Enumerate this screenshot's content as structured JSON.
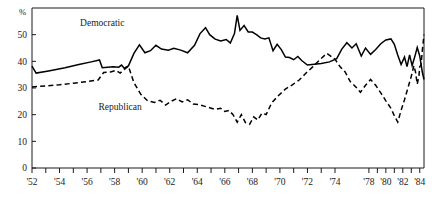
{
  "chart_data": {
    "type": "line",
    "title": "",
    "xlabel": "",
    "ylabel": "%",
    "ylim": [
      0,
      60
    ],
    "xlim": [
      1952,
      1984.5
    ],
    "grid": false,
    "legend": "inline-annotations",
    "ytick_labels": [
      "0",
      "10",
      "20",
      "30",
      "40",
      "50"
    ],
    "ytick_values": [
      0,
      10,
      20,
      30,
      40,
      50
    ],
    "xtick_labels": [
      "'52",
      "'54",
      "'56",
      "'58",
      "'60",
      "'62",
      "'64",
      "'66",
      "'68",
      "'70",
      "'72",
      "'74",
      "'78",
      "'80",
      "'82",
      "'84"
    ],
    "xtick_values": [
      1952,
      1954,
      1956,
      1958,
      1960,
      1962,
      1964,
      1966,
      1968,
      1970,
      1972,
      1974,
      1978,
      1980,
      1982,
      1984
    ],
    "minor_xticks": [
      1953,
      1955,
      1957,
      1959,
      1961,
      1963,
      1965,
      1967,
      1969,
      1971,
      1973,
      1979,
      1981,
      1983
    ],
    "series": [
      {
        "name": "Democratic",
        "style": "solid",
        "color": "#000000",
        "annotation": "Democratic",
        "annotation_x": 1957.1,
        "annotation_y": 53.2,
        "points": [
          [
            1952.0,
            38.2
          ],
          [
            1952.3,
            35.6
          ],
          [
            1953.2,
            36.4
          ],
          [
            1954.4,
            37.6
          ],
          [
            1955.4,
            38.8
          ],
          [
            1956.3,
            39.8
          ],
          [
            1956.9,
            40.5
          ],
          [
            1957.1,
            37.6
          ],
          [
            1957.9,
            38.0
          ],
          [
            1958.3,
            37.8
          ],
          [
            1958.5,
            38.6
          ],
          [
            1958.7,
            37.4
          ],
          [
            1959.0,
            38.3
          ],
          [
            1959.4,
            43.0
          ],
          [
            1959.8,
            46.2
          ],
          [
            1960.2,
            43.2
          ],
          [
            1960.6,
            44.0
          ],
          [
            1961.0,
            46.0
          ],
          [
            1961.4,
            44.6
          ],
          [
            1961.9,
            44.2
          ],
          [
            1962.3,
            44.9
          ],
          [
            1962.8,
            44.2
          ],
          [
            1963.3,
            43.2
          ],
          [
            1963.8,
            46.0
          ],
          [
            1964.2,
            50.4
          ],
          [
            1964.6,
            52.6
          ],
          [
            1964.9,
            50.0
          ],
          [
            1965.3,
            48.3
          ],
          [
            1965.7,
            47.6
          ],
          [
            1966.1,
            48.2
          ],
          [
            1966.4,
            46.9
          ],
          [
            1966.7,
            50.4
          ],
          [
            1966.9,
            57.2
          ],
          [
            1967.1,
            51.6
          ],
          [
            1967.4,
            53.4
          ],
          [
            1967.7,
            51.0
          ],
          [
            1968.0,
            51.0
          ],
          [
            1968.3,
            50.0
          ],
          [
            1968.6,
            48.8
          ],
          [
            1968.9,
            48.4
          ],
          [
            1969.2,
            48.8
          ],
          [
            1969.5,
            44.0
          ],
          [
            1969.8,
            46.4
          ],
          [
            1970.1,
            44.4
          ],
          [
            1970.4,
            41.6
          ],
          [
            1970.7,
            41.4
          ],
          [
            1971.0,
            40.6
          ],
          [
            1971.3,
            41.8
          ],
          [
            1971.6,
            40.2
          ],
          [
            1972.0,
            38.6
          ],
          [
            1972.5,
            38.9
          ],
          [
            1973.0,
            39.2
          ],
          [
            1973.6,
            39.8
          ],
          [
            1974.2,
            41.0
          ],
          [
            1974.8,
            44.6
          ],
          [
            1975.4,
            47.0
          ],
          [
            1976.0,
            45.0
          ],
          [
            1976.5,
            46.6
          ],
          [
            1977.1,
            42.0
          ],
          [
            1977.6,
            45.0
          ],
          [
            1978.2,
            42.6
          ],
          [
            1978.8,
            44.4
          ],
          [
            1979.4,
            46.6
          ],
          [
            1980.0,
            48.0
          ],
          [
            1980.6,
            48.4
          ],
          [
            1981.0,
            46.4
          ],
          [
            1981.4,
            42.4
          ],
          [
            1981.8,
            38.8
          ],
          [
            1982.2,
            41.6
          ],
          [
            1982.5,
            38.0
          ],
          [
            1982.8,
            42.4
          ],
          [
            1983.1,
            38.4
          ],
          [
            1983.4,
            41.6
          ],
          [
            1983.7,
            45.2
          ],
          [
            1984.0,
            42.0
          ],
          [
            1984.3,
            36.0
          ],
          [
            1984.5,
            33.2
          ]
        ]
      },
      {
        "name": "Republican",
        "style": "dashed",
        "color": "#000000",
        "annotation": "Republican",
        "annotation_x": 1958.4,
        "annotation_y": 21.6,
        "points": [
          [
            1952.0,
            30.4
          ],
          [
            1953.0,
            30.8
          ],
          [
            1954.0,
            31.2
          ],
          [
            1955.0,
            31.8
          ],
          [
            1956.0,
            32.4
          ],
          [
            1956.8,
            33.0
          ],
          [
            1957.2,
            35.8
          ],
          [
            1957.7,
            36.0
          ],
          [
            1958.1,
            36.6
          ],
          [
            1958.4,
            35.6
          ],
          [
            1958.7,
            37.0
          ],
          [
            1959.0,
            38.2
          ],
          [
            1959.4,
            32.0
          ],
          [
            1959.9,
            27.6
          ],
          [
            1960.4,
            25.2
          ],
          [
            1960.9,
            24.6
          ],
          [
            1961.3,
            25.4
          ],
          [
            1961.7,
            23.6
          ],
          [
            1962.1,
            25.0
          ],
          [
            1962.5,
            26.0
          ],
          [
            1962.9,
            24.8
          ],
          [
            1963.3,
            25.6
          ],
          [
            1963.7,
            24.0
          ],
          [
            1964.1,
            23.8
          ],
          [
            1964.5,
            23.2
          ],
          [
            1964.9,
            22.6
          ],
          [
            1965.3,
            22.0
          ],
          [
            1965.7,
            22.4
          ],
          [
            1966.0,
            21.2
          ],
          [
            1966.3,
            21.6
          ],
          [
            1966.6,
            20.0
          ],
          [
            1966.9,
            17.2
          ],
          [
            1967.2,
            20.0
          ],
          [
            1967.5,
            17.0
          ],
          [
            1967.8,
            16.4
          ],
          [
            1968.1,
            19.2
          ],
          [
            1968.4,
            18.0
          ],
          [
            1968.7,
            20.6
          ],
          [
            1969.0,
            20.0
          ],
          [
            1969.4,
            24.4
          ],
          [
            1969.9,
            27.2
          ],
          [
            1970.4,
            29.6
          ],
          [
            1970.9,
            31.2
          ],
          [
            1971.4,
            33.0
          ],
          [
            1971.9,
            35.6
          ],
          [
            1972.4,
            38.0
          ],
          [
            1972.9,
            40.6
          ],
          [
            1973.4,
            43.0
          ],
          [
            1974.0,
            40.8
          ],
          [
            1974.6,
            38.0
          ],
          [
            1975.2,
            36.0
          ],
          [
            1975.8,
            32.4
          ],
          [
            1976.4,
            30.6
          ],
          [
            1977.0,
            28.4
          ],
          [
            1977.6,
            31.0
          ],
          [
            1978.2,
            33.2
          ],
          [
            1978.8,
            31.0
          ],
          [
            1979.4,
            28.2
          ],
          [
            1980.0,
            25.2
          ],
          [
            1980.6,
            22.4
          ],
          [
            1981.0,
            19.6
          ],
          [
            1981.4,
            17.2
          ],
          [
            1981.8,
            21.6
          ],
          [
            1982.2,
            25.6
          ],
          [
            1982.6,
            30.0
          ],
          [
            1983.0,
            34.4
          ],
          [
            1983.3,
            38.4
          ],
          [
            1983.5,
            36.0
          ],
          [
            1983.7,
            31.4
          ],
          [
            1983.9,
            34.4
          ],
          [
            1984.0,
            38.0
          ],
          [
            1984.15,
            38.6
          ],
          [
            1984.3,
            44.0
          ],
          [
            1984.5,
            50.0
          ]
        ]
      }
    ]
  }
}
